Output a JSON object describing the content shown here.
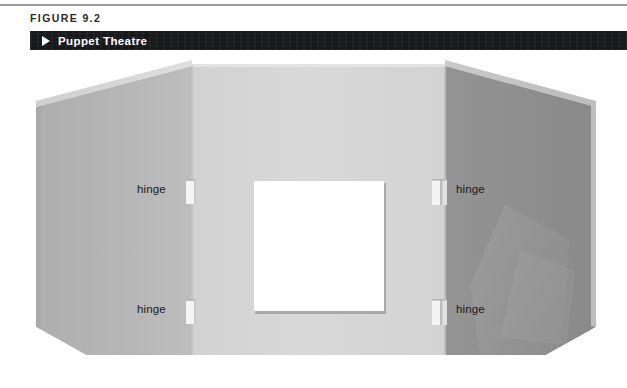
{
  "figure": {
    "number_label": "FIGURE 9.2",
    "title": "Puppet Theatre",
    "arrow_icon": "triangle-right-icon",
    "bar_color": "#17181a",
    "rule_color": "#9b9b9b"
  },
  "illustration": {
    "name": "puppet-theatre-three-panel-folding-screen",
    "panels": [
      {
        "id": "left-wing",
        "label": "left wing panel",
        "fill": "#b4b4b4",
        "top_edge_fill": "#d8d8d8",
        "description": "angled left wing, top edge slopes upward toward the center fold, bottom corner beveled"
      },
      {
        "id": "center-panel",
        "label": "center panel with proscenium window",
        "fill": "#d5d5d5",
        "description": "flat front-facing panel containing the white stage opening"
      },
      {
        "id": "right-wing",
        "label": "right wing panel",
        "fill": "#8f8f8f",
        "top_edge_fill": "#c4c4c4",
        "description": "angled right wing, darker shading, top edge slopes downward away from the center fold"
      }
    ],
    "window": {
      "id": "stage-opening",
      "label": "stage opening",
      "fill": "#ffffff",
      "shadow": "#a9a9a9"
    },
    "hinges": [
      {
        "id": "hinge-left-top",
        "label": "hinge",
        "side": "left",
        "position": "top"
      },
      {
        "id": "hinge-left-bottom",
        "label": "hinge",
        "side": "left",
        "position": "bottom"
      },
      {
        "id": "hinge-right-top",
        "label": "hinge",
        "side": "right",
        "position": "top"
      },
      {
        "id": "hinge-right-bottom",
        "label": "hinge",
        "side": "right",
        "position": "bottom"
      }
    ],
    "hinge_fill": "#f2f2f2",
    "background": "#ffffff"
  }
}
